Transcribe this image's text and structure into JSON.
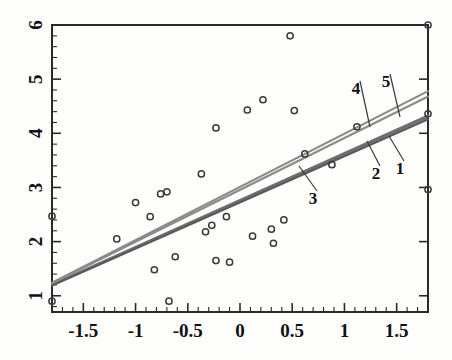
{
  "chart_data": {
    "type": "scatter",
    "title": "",
    "xlabel": "",
    "ylabel": "",
    "xlim": [
      -1.8,
      1.8
    ],
    "ylim": [
      0.7,
      6.0
    ],
    "grid": false,
    "legend_position": "inline-callouts",
    "x_ticks": [
      {
        "value": -1.5,
        "label": "-1.5"
      },
      {
        "value": -1.0,
        "label": "-1"
      },
      {
        "value": -0.5,
        "label": "-0.5"
      },
      {
        "value": 0.0,
        "label": "0"
      },
      {
        "value": 0.5,
        "label": "0.5"
      },
      {
        "value": 1.0,
        "label": "1"
      },
      {
        "value": 1.5,
        "label": "1.5"
      }
    ],
    "x_minor_step": 0.1,
    "y_ticks": [
      {
        "value": 1,
        "label": "1"
      },
      {
        "value": 2,
        "label": "2"
      },
      {
        "value": 3,
        "label": "3"
      },
      {
        "value": 4,
        "label": "4"
      },
      {
        "value": 5,
        "label": "5"
      },
      {
        "value": 6,
        "label": "6"
      }
    ],
    "y_minor_step": 0.2,
    "points": [
      {
        "x": -1.8,
        "y": 2.47
      },
      {
        "x": -1.8,
        "y": 0.9
      },
      {
        "x": -1.18,
        "y": 2.05
      },
      {
        "x": -1.0,
        "y": 2.72
      },
      {
        "x": -0.86,
        "y": 2.46
      },
      {
        "x": -0.82,
        "y": 1.48
      },
      {
        "x": -0.76,
        "y": 2.88
      },
      {
        "x": -0.7,
        "y": 2.92
      },
      {
        "x": -0.68,
        "y": 0.9
      },
      {
        "x": -0.62,
        "y": 1.72
      },
      {
        "x": -0.37,
        "y": 3.25
      },
      {
        "x": -0.33,
        "y": 2.18
      },
      {
        "x": -0.27,
        "y": 2.3
      },
      {
        "x": -0.23,
        "y": 4.1
      },
      {
        "x": -0.23,
        "y": 1.65
      },
      {
        "x": -0.13,
        "y": 2.46
      },
      {
        "x": -0.1,
        "y": 1.62
      },
      {
        "x": 0.07,
        "y": 4.43
      },
      {
        "x": 0.12,
        "y": 2.1
      },
      {
        "x": 0.22,
        "y": 4.62
      },
      {
        "x": 0.3,
        "y": 2.23
      },
      {
        "x": 0.32,
        "y": 1.97
      },
      {
        "x": 0.42,
        "y": 2.4
      },
      {
        "x": 0.48,
        "y": 5.8
      },
      {
        "x": 0.52,
        "y": 4.42
      },
      {
        "x": 0.62,
        "y": 3.62
      },
      {
        "x": 0.88,
        "y": 3.42
      },
      {
        "x": 1.12,
        "y": 4.12
      },
      {
        "x": 1.8,
        "y": 6.0
      },
      {
        "x": 1.8,
        "y": 4.36
      },
      {
        "x": 1.8,
        "y": 2.96
      }
    ],
    "lines": [
      {
        "id": "1",
        "label": "1",
        "x0": -1.8,
        "y0": 1.2,
        "x1": 1.8,
        "y1": 4.3,
        "color": "#6f6f6f"
      },
      {
        "id": "2",
        "label": "2",
        "x0": -1.8,
        "y0": 1.21,
        "x1": 1.8,
        "y1": 4.33,
        "color": "#6f6f6f"
      },
      {
        "id": "3",
        "label": "3",
        "x0": -1.8,
        "y0": 1.19,
        "x1": 1.8,
        "y1": 4.26,
        "color": "#595959"
      },
      {
        "id": "4",
        "label": "4",
        "x0": -1.8,
        "y0": 1.23,
        "x1": 1.8,
        "y1": 4.68,
        "color": "#8a8a8a"
      },
      {
        "id": "5",
        "label": "5",
        "x0": -1.8,
        "y0": 1.24,
        "x1": 1.8,
        "y1": 4.78,
        "color": "#8a8a8a"
      }
    ],
    "callouts": [
      {
        "label": "1",
        "text_x": 400,
        "text_y": 174,
        "leader_x": 389,
        "leader_y": 136
      },
      {
        "label": "2",
        "text_x": 376,
        "text_y": 179,
        "leader_x": 367,
        "leader_y": 141
      },
      {
        "label": "3",
        "text_x": 313,
        "text_y": 204,
        "leader_x": 299,
        "leader_y": 166
      },
      {
        "label": "4",
        "text_x": 356,
        "text_y": 94,
        "leader_x": 370,
        "leader_y": 127
      },
      {
        "label": "5",
        "text_x": 386,
        "text_y": 87,
        "leader_x": 400,
        "leader_y": 117
      }
    ]
  }
}
